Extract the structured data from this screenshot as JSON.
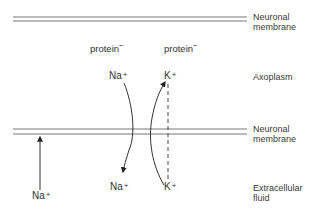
{
  "diagram": {
    "type": "neuronal membrane ion movement",
    "regions": {
      "top_membrane": {
        "line1": "Neuronal",
        "line2": "membrane"
      },
      "axoplasm": "Axoplasm",
      "bottom_membrane": {
        "line1": "Neuronal",
        "line2": "membrane"
      },
      "extracellular": {
        "line1": "Extracellular",
        "line2": "fluid"
      }
    },
    "proteins": [
      {
        "label": "protein",
        "charge": "−"
      },
      {
        "label": "protein",
        "charge": "−"
      }
    ],
    "ions": {
      "na_axoplasm": {
        "symbol": "Na",
        "charge": "+"
      },
      "k_axoplasm": {
        "symbol": "K",
        "charge": "+"
      },
      "na_extracellular_left": {
        "symbol": "Na",
        "charge": "+"
      },
      "na_extracellular": {
        "symbol": "Na",
        "charge": "+"
      },
      "k_extracellular": {
        "symbol": "K",
        "charge": "+"
      }
    },
    "arrows": [
      {
        "from": "extracellular Na+",
        "to": "membrane",
        "style": "solid",
        "direction": "up"
      },
      {
        "from": "axoplasm Na+",
        "to": "extracellular Na+",
        "style": "solid curved",
        "direction": "down"
      },
      {
        "from": "extracellular K+",
        "to": "axoplasm K+",
        "style": "solid curved",
        "direction": "up"
      },
      {
        "from": "axoplasm K+",
        "to": "extracellular K+",
        "style": "dashed",
        "direction": "none"
      }
    ],
    "colors": {
      "line": "#555555",
      "text": "#333333",
      "background": "#ffffff"
    }
  }
}
